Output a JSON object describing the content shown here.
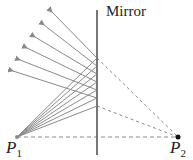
{
  "diagram": {
    "mirror_label": "Mirror",
    "points": [
      {
        "name": "P",
        "sub": "1",
        "x": 17,
        "y": 137
      },
      {
        "name": "P",
        "sub": "2",
        "x": 178,
        "y": 137
      }
    ],
    "mirror": {
      "x": 97,
      "y1": 10,
      "y2": 155
    },
    "reflection_points_y": [
      58,
      66,
      74,
      82,
      90,
      98,
      106
    ],
    "colors": {
      "ray": "#8a8a8a",
      "mirror": "#777777",
      "dashed": "#8a8a8a",
      "point": "#111111"
    }
  }
}
